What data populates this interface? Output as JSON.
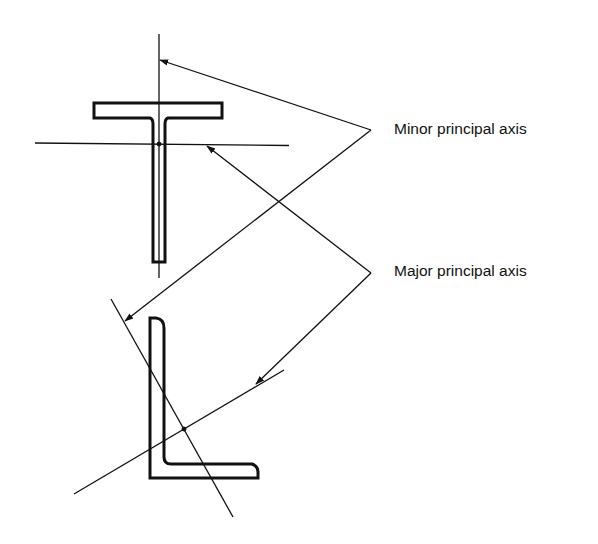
{
  "figure": {
    "labels": {
      "minor": "Minor principal axis",
      "major": "Major principal axis"
    },
    "sections": [
      "T-section",
      "Angle section"
    ],
    "colors": {
      "ink": "#111111",
      "background": "#ffffff"
    }
  }
}
